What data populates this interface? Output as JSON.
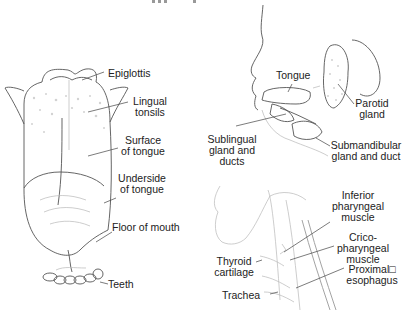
{
  "figure": {
    "top_clipped_title": "",
    "panels": [
      {
        "name": "tongue-top-view",
        "labels": {
          "epiglottis": "Epiglottis",
          "lingual_tonsils": [
            "Lingual",
            "tonsils"
          ],
          "surface_of_tongue": [
            "Surface",
            "of tongue"
          ],
          "underside_of_tongue": [
            "Underside",
            "of tongue"
          ],
          "floor_of_mouth": "Floor of mouth",
          "teeth": "Teeth"
        }
      },
      {
        "name": "head-side-glands",
        "labels": {
          "tongue": "Tongue",
          "parotid_gland": [
            "Parotid",
            "gland"
          ],
          "sublingual_gland": [
            "Sublingual",
            "gland and",
            "ducts"
          ],
          "submandibular_gland": [
            "Submandibular",
            "gland and duct"
          ]
        }
      },
      {
        "name": "neck-side-view",
        "labels": {
          "inferior_pharyngeal": [
            "Inferior",
            "pharyngeal",
            "muscle"
          ],
          "cricopharyngeal": [
            "Crico-",
            "pharyngeal",
            "muscle"
          ],
          "thyroid_cartilage": [
            "Thyroid",
            "cartilage"
          ],
          "proximal_esophagus": [
            "Proximal□",
            "esophagus"
          ],
          "trachea": "Trachea"
        }
      }
    ]
  }
}
